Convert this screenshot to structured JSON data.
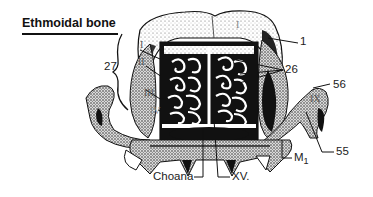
{
  "figure": {
    "title": "Ethmoidal bone",
    "labels": {
      "l1": "1",
      "l26": "26",
      "l27": "27",
      "l55": "55",
      "l56": "56",
      "choana": "Choana",
      "xv": "XV.",
      "m1_main": "M",
      "m1_sub": "1"
    },
    "roman_numerals": {
      "i_left": "I",
      "ii": "II",
      "iii": "III",
      "iv": "IV",
      "ix": "IX",
      "i_top": "I"
    },
    "colors": {
      "ink": "#111111",
      "stipple": "#888888",
      "background": "#ffffff"
    }
  }
}
